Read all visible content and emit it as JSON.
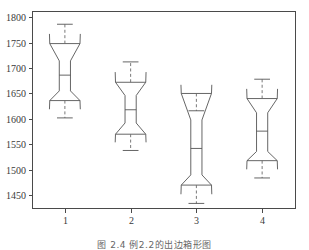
{
  "caption": "图 2.4  例2.2的出边箱形图",
  "chart_data": {
    "type": "box",
    "title": "",
    "xlabel": "",
    "ylabel": "",
    "grid": false,
    "legend": false,
    "notched": true,
    "categories": [
      "1",
      "2",
      "3",
      "4"
    ],
    "x_tick_labels": [
      "1",
      "2",
      "3",
      "4"
    ],
    "y_tick_labels": [
      "1450",
      "1500",
      "1550",
      "1600",
      "1650",
      "1700",
      "1750",
      "1800"
    ],
    "y_ticks": [
      1450,
      1500,
      1550,
      1600,
      1650,
      1700,
      1750,
      1800
    ],
    "ylim": [
      1425,
      1812
    ],
    "xlim": [
      0.5,
      4.5
    ],
    "boxes": [
      {
        "label": "1",
        "x": 1,
        "whisker_low": 1602,
        "q1": 1636,
        "median": 1686,
        "q3": 1748,
        "whisker_high": 1786,
        "notch_low": 1655,
        "notch_high": 1714,
        "notch_half_width": 0.085,
        "box_half_width": 0.23
      },
      {
        "label": "2",
        "x": 2,
        "whisker_low": 1538,
        "q1": 1570,
        "median": 1618,
        "q3": 1672,
        "whisker_high": 1712,
        "notch_low": 1592,
        "notch_high": 1646,
        "notch_half_width": 0.085,
        "box_half_width": 0.23
      },
      {
        "label": "3",
        "x": 3,
        "whisker_low": 1434,
        "q1": 1470,
        "median": 1542,
        "q3": 1650,
        "whisker_high": 1616,
        "notch_low": 1490,
        "notch_high": 1598,
        "notch_half_width": 0.085,
        "box_half_width": 0.23
      },
      {
        "label": "4",
        "x": 4,
        "whisker_low": 1484,
        "q1": 1518,
        "median": 1576,
        "q3": 1640,
        "whisker_high": 1678,
        "notch_low": 1536,
        "notch_high": 1612,
        "notch_half_width": 0.085,
        "box_half_width": 0.23
      }
    ],
    "colors": {
      "axis": "#4a4a4a",
      "box": "#555555",
      "whisker": "#6a6a6a",
      "text": "#3a3a3a",
      "background": "#ffffff"
    }
  }
}
